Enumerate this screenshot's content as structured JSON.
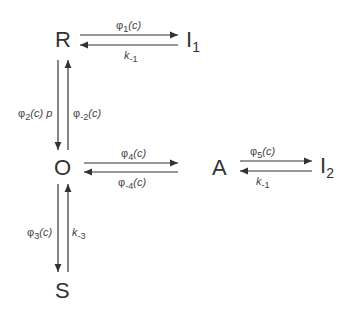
{
  "nodes": {
    "R": "R",
    "I1": "I",
    "I1_sub": "1",
    "O": "O",
    "A": "A",
    "I2": "I",
    "I2_sub": "2",
    "S": "S"
  },
  "edges": {
    "R_to_I1": {
      "sym": "φ",
      "sub": "1",
      "arg": "(c)"
    },
    "I1_to_R": {
      "sym": "k",
      "sub": "-1"
    },
    "R_to_O": {
      "sym": "φ",
      "sub": "2",
      "arg": "(c)",
      "extra": "p"
    },
    "O_to_R": {
      "sym": "φ",
      "sub": "-2",
      "arg": "(c)"
    },
    "O_to_A": {
      "sym": "φ",
      "sub": "4",
      "arg": "(c)"
    },
    "A_to_O": {
      "sym": "φ",
      "sub": "-4",
      "arg": "(c)"
    },
    "A_to_I2": {
      "sym": "φ",
      "sub": "5",
      "arg": "(c)"
    },
    "I2_to_A": {
      "sym": "k",
      "sub": "-1"
    },
    "O_to_S": {
      "sym": "φ",
      "sub": "3",
      "arg": "(c)"
    },
    "S_to_O": {
      "sym": "k",
      "sub": "-3"
    }
  },
  "colors": {
    "line": "#333333",
    "text": "#3a3a3a"
  }
}
